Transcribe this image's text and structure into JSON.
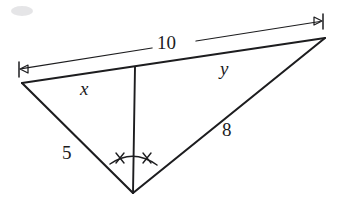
{
  "figure": {
    "kind": "geometry-diagram",
    "background_color": "#ffffff",
    "stroke_color": "#1d1d1f",
    "labels": {
      "total_top": "10",
      "segment_left": "x",
      "segment_right": "y",
      "side_left": "5",
      "side_right": "8"
    },
    "vertices": {
      "left": [
        22,
        83
      ],
      "right": [
        325,
        38
      ],
      "bottom": [
        133,
        193
      ],
      "cevian_foot": [
        135,
        67
      ]
    },
    "dimension_line": {
      "from": [
        20,
        69
      ],
      "to": [
        322,
        21
      ],
      "label": "10",
      "gap_start_x": 152,
      "gap_end_x": 196
    },
    "angle_marks": {
      "count": 2,
      "meaning": "congruent angles (angle bisector)"
    }
  }
}
